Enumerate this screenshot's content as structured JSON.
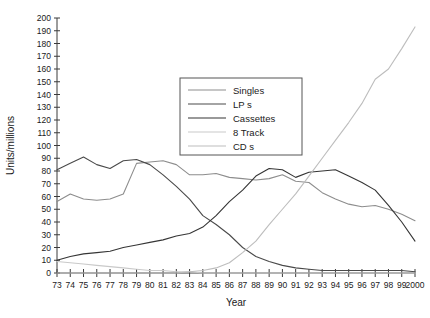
{
  "chart_data": {
    "type": "line",
    "title": "",
    "xlabel": "Year",
    "ylabel": "Units/millions",
    "grid": false,
    "legend_position": "upper-center",
    "xlim": [
      1973,
      2000
    ],
    "ylim": [
      0,
      200
    ],
    "ytick_step": 10,
    "x": [
      1973,
      1974,
      1975,
      1976,
      1977,
      1978,
      1979,
      1980,
      1981,
      1982,
      1983,
      1984,
      1985,
      1986,
      1987,
      1988,
      1989,
      1990,
      1991,
      1992,
      1993,
      1994,
      1995,
      1996,
      1997,
      1998,
      1999,
      2000
    ],
    "xtick_labels": [
      "73",
      "74",
      "75",
      "76",
      "77",
      "78",
      "79",
      "80",
      "81",
      "82",
      "83",
      "84",
      "85",
      "86",
      "87",
      "88",
      "89",
      "90",
      "91",
      "92",
      "93",
      "94",
      "95",
      "96",
      "97",
      "98",
      "99",
      "2000"
    ],
    "ytick_labels": [
      "0",
      "10",
      "20",
      "30",
      "40",
      "50",
      "60",
      "70",
      "80",
      "90",
      "100",
      "110",
      "120",
      "130",
      "140",
      "150",
      "160",
      "170",
      "180",
      "190",
      "200"
    ],
    "series": [
      {
        "name": "Singles",
        "color": "#8d8d8d",
        "values": [
          56,
          62,
          58,
          57,
          58,
          62,
          86,
          87,
          88,
          85,
          77,
          77,
          78,
          75,
          74,
          73,
          74,
          77,
          72,
          71,
          63,
          58,
          54,
          52,
          53,
          50,
          46,
          41
        ]
      },
      {
        "name": "LP s",
        "color": "#4a4a4a",
        "values": [
          81,
          86,
          91,
          85,
          82,
          88,
          89,
          85,
          77,
          68,
          58,
          45,
          38,
          30,
          20,
          13,
          9,
          6,
          4,
          3,
          2,
          2,
          2,
          2,
          2,
          2,
          2,
          1
        ]
      },
      {
        "name": "Cassettes",
        "color": "#353535",
        "values": [
          10,
          13,
          15,
          16,
          17,
          20,
          22,
          24,
          26,
          29,
          31,
          36,
          45,
          56,
          65,
          76,
          82,
          81,
          75,
          79,
          80,
          81,
          76,
          71,
          65,
          53,
          40,
          25
        ]
      },
      {
        "name": "8 Track",
        "color": "#c9c9c9",
        "values": [
          9,
          8,
          7,
          6,
          5,
          4,
          3,
          2,
          2,
          1,
          1,
          0,
          0,
          0,
          0,
          0,
          0,
          0,
          0,
          0,
          0,
          0,
          0,
          0,
          0,
          0,
          0,
          0
        ]
      },
      {
        "name": "CD s",
        "color": "#bdbdbd",
        "values": [
          0,
          0,
          0,
          0,
          0,
          0,
          0,
          0,
          0,
          0,
          1,
          2,
          4,
          8,
          16,
          25,
          38,
          50,
          62,
          76,
          90,
          104,
          118,
          133,
          152,
          160,
          176,
          193
        ]
      }
    ]
  },
  "legend": {
    "entries": [
      "Singles",
      "LP s",
      "Cassettes",
      "8 Track",
      "CD s"
    ]
  },
  "axes": {
    "x_title": "Year",
    "y_title": "Units/millions"
  },
  "caption": {
    "text": ""
  }
}
